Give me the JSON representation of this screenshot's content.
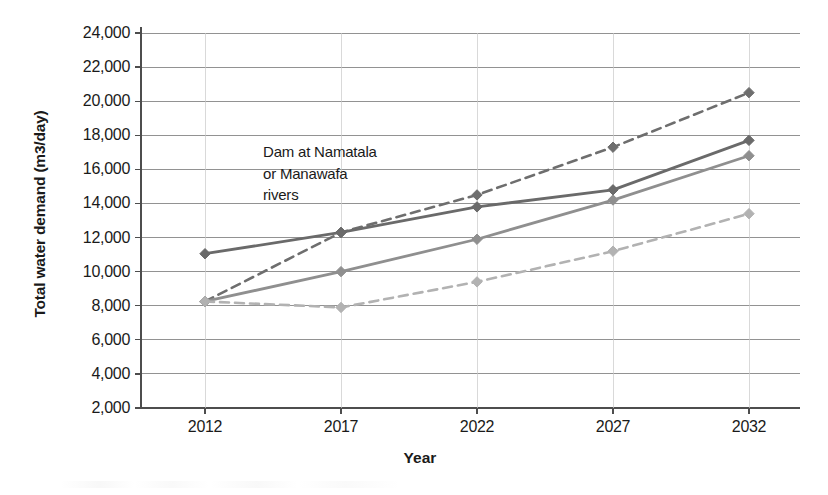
{
  "chart_data": {
    "type": "line",
    "title": "",
    "xlabel": "Year",
    "ylabel": "Total water demand (m3/day)",
    "categories": [
      2012,
      2017,
      2022,
      2027,
      2032
    ],
    "x_tick_labels": [
      "2012",
      "2017",
      "2022",
      "2027",
      "2032"
    ],
    "y_tick_labels": [
      "24,000",
      "22,000",
      "20,000",
      "18,000",
      "16,000",
      "14,000",
      "12,000",
      "10,000",
      "8,000",
      "6,000",
      "4,000",
      "2,000"
    ],
    "y_ticks": [
      24000,
      22000,
      20000,
      18000,
      16000,
      14000,
      12000,
      10000,
      8000,
      6000,
      4000,
      2000
    ],
    "ylim": [
      2000,
      24000
    ],
    "grid": true,
    "legend": "none",
    "series": [
      {
        "name": "high-demand-dashed",
        "style": "dashed",
        "color": "#6e6e6e",
        "marker": "diamond",
        "values": [
          8250,
          12300,
          14500,
          17300,
          20500
        ]
      },
      {
        "name": "upper-solid",
        "style": "solid",
        "color": "#6a6a6a",
        "marker": "diamond",
        "values": [
          11050,
          12300,
          13800,
          14800,
          17700
        ]
      },
      {
        "name": "mid-solid",
        "style": "solid",
        "color": "#8f8f8f",
        "marker": "diamond",
        "values": [
          8250,
          10000,
          11900,
          14200,
          16800
        ]
      },
      {
        "name": "low-demand-dashed",
        "style": "dashed",
        "color": "#b2b2b2",
        "marker": "diamond",
        "values": [
          8250,
          7900,
          9400,
          11200,
          13400
        ]
      }
    ],
    "annotations": [
      {
        "name": "dam-annotation",
        "text": "Dam at Namatala\nor  Manawafa\nrivers",
        "x": 2017,
        "y": 16500
      }
    ]
  },
  "axis": {
    "x_title": "Year",
    "y_title": "Total water demand (m3/day)"
  },
  "colors": {
    "grid": "#808080",
    "axis": "#4d4d4d",
    "series_dark": "#6a6a6a",
    "series_mid": "#8f8f8f",
    "series_light": "#b2b2b2",
    "text": "#1a1a1a"
  }
}
